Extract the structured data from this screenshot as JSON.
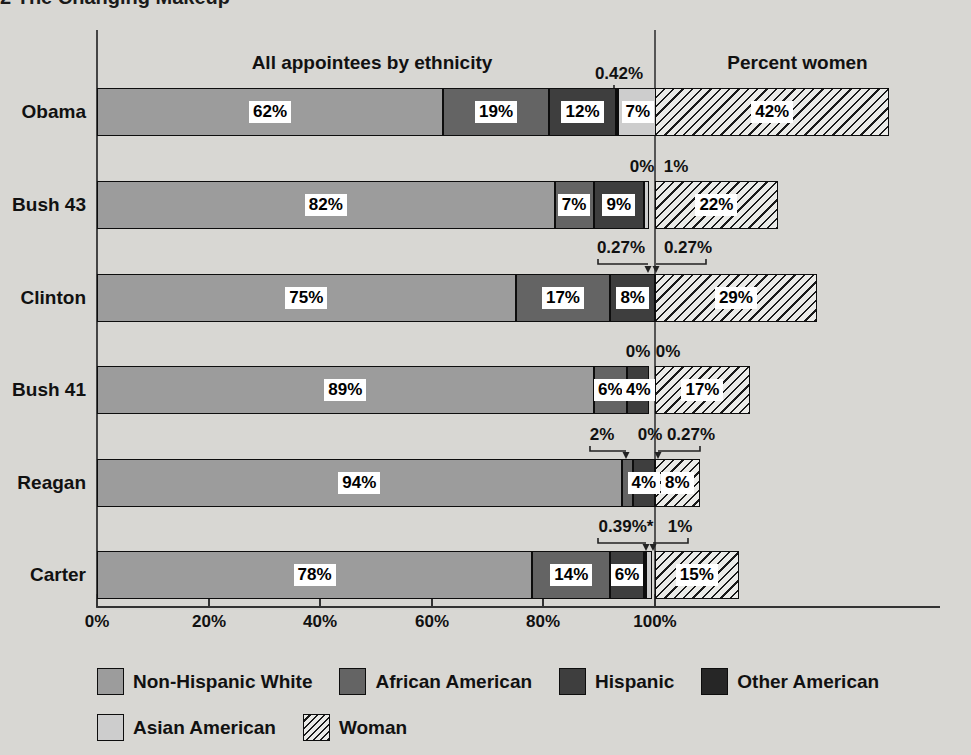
{
  "title_fragment": "2 The Changing Makeup",
  "headers": {
    "left": "All appointees by ethnicity",
    "right": "Percent women"
  },
  "axis": {
    "ticks": [
      "0%",
      "20%",
      "40%",
      "60%",
      "80%",
      "100%"
    ]
  },
  "colors": {
    "background": "#d8d7d3",
    "non_hispanic_white": "#9c9c9c",
    "african_american": "#646464",
    "hispanic": "#3e3e3e",
    "other_american": "#262626",
    "asian_american": "#cdcdcd",
    "woman_hatch_background": "#ebebe8",
    "hatch_line": "#1a1a1a",
    "label_box": "#ffffff"
  },
  "legend": {
    "items": [
      "Non-Hispanic White",
      "African American",
      "Hispanic",
      "Other American",
      "Asian American",
      "Woman"
    ]
  },
  "chart_data": {
    "type": "bar",
    "orientation": "horizontal-stacked",
    "section_labels": [
      "All appointees by ethnicity",
      "Percent women"
    ],
    "categories": [
      "Obama",
      "Bush 43",
      "Clinton",
      "Bush 41",
      "Reagan",
      "Carter"
    ],
    "series": [
      {
        "name": "Non-Hispanic White",
        "values": [
          62,
          82,
          75,
          89,
          94,
          78
        ]
      },
      {
        "name": "African American",
        "values": [
          19,
          7,
          17,
          6,
          2,
          14
        ]
      },
      {
        "name": "Hispanic",
        "values": [
          12,
          9,
          8,
          4,
          4,
          6
        ]
      },
      {
        "name": "Other American",
        "values": [
          0.42,
          0,
          0.27,
          0,
          0,
          0.39
        ]
      },
      {
        "name": "Asian American",
        "values": [
          7,
          1,
          0.27,
          0,
          0.27,
          1
        ]
      },
      {
        "name": "Woman",
        "values": [
          42,
          22,
          29,
          17,
          8,
          15
        ]
      }
    ],
    "x_ticks": [
      "0%",
      "20%",
      "40%",
      "60%",
      "80%",
      "100%"
    ],
    "xlim": [
      0,
      100
    ],
    "legend_position": "bottom",
    "grid": false
  },
  "rows": [
    {
      "president": "Obama",
      "segments": {
        "white": 62,
        "african_american": 19,
        "hispanic": 12,
        "other_american": 0.42,
        "asian_american": 7,
        "woman": 42
      },
      "labels": {
        "white": "62%",
        "african_american": "19%",
        "hispanic": "12%",
        "asian_american": "7%",
        "woman": "42%"
      },
      "callouts": [
        "0.42%"
      ]
    },
    {
      "president": "Bush 43",
      "segments": {
        "white": 82,
        "african_american": 7,
        "hispanic": 9,
        "other_american": 0,
        "asian_american": 1,
        "woman": 22
      },
      "labels": {
        "white": "82%",
        "african_american": "7%",
        "hispanic": "9%",
        "woman": "22%"
      },
      "callouts": [
        "0%",
        "1%"
      ]
    },
    {
      "president": "Clinton",
      "segments": {
        "white": 75,
        "african_american": 17,
        "hispanic": 8,
        "other_american": 0.27,
        "asian_american": 0.27,
        "woman": 29
      },
      "labels": {
        "white": "75%",
        "african_american": "17%",
        "hispanic": "8%",
        "woman": "29%"
      },
      "callouts": [
        "0.27%",
        "0.27%"
      ]
    },
    {
      "president": "Bush 41",
      "segments": {
        "white": 89,
        "african_american": 6,
        "hispanic": 4,
        "other_american": 0,
        "asian_american": 0,
        "woman": 17
      },
      "labels": {
        "white": "89%",
        "african_american": "6%",
        "hispanic": "4%",
        "woman": "17%"
      },
      "callouts": [
        "0%",
        "0%"
      ]
    },
    {
      "president": "Reagan",
      "segments": {
        "white": 94,
        "african_american": 2,
        "hispanic": 4,
        "other_american": 0,
        "asian_american": 0.27,
        "woman": 8
      },
      "labels": {
        "white": "94%",
        "hispanic": "4%",
        "woman": "8%"
      },
      "callouts": [
        "2%",
        "0%",
        "0.27%"
      ]
    },
    {
      "president": "Carter",
      "segments": {
        "white": 78,
        "african_american": 14,
        "hispanic": 6,
        "other_american": 0.39,
        "asian_american": 1,
        "woman": 15
      },
      "labels": {
        "white": "78%",
        "african_american": "14%",
        "hispanic": "6%",
        "woman": "15%"
      },
      "callouts": [
        "0.39%*",
        "1%"
      ]
    }
  ]
}
